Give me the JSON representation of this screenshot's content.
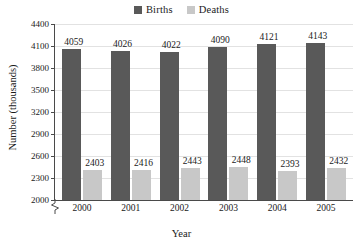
{
  "chart_data": {
    "type": "bar",
    "title": "",
    "xlabel": "Year",
    "ylabel": "Number (thousands)",
    "categories": [
      "2000",
      "2001",
      "2002",
      "2003",
      "2004",
      "2005"
    ],
    "series": [
      {
        "name": "Births",
        "color": "#595959",
        "values": [
          4059,
          4026,
          4022,
          4090,
          4121,
          4143
        ]
      },
      {
        "name": "Deaths",
        "color": "#c8c8c8",
        "values": [
          2403,
          2416,
          2443,
          2448,
          2393,
          2432
        ]
      }
    ],
    "ylim": [
      2000,
      4400
    ],
    "ytick_labels": [
      "4400",
      "4100",
      "3800",
      "3500",
      "3200",
      "2900",
      "2600",
      "2300",
      "2000"
    ],
    "ytick_values": [
      4400,
      4100,
      3800,
      3500,
      3200,
      2900,
      2600,
      2300,
      2000
    ],
    "grid": true,
    "legend_position": "top-center",
    "axis_break": true
  },
  "legend": {
    "items": [
      {
        "label": "Births",
        "color": "#595959"
      },
      {
        "label": "Deaths",
        "color": "#c8c8c8"
      }
    ]
  },
  "axes": {
    "x_title": "Year",
    "y_title": "Number (thousands)"
  }
}
